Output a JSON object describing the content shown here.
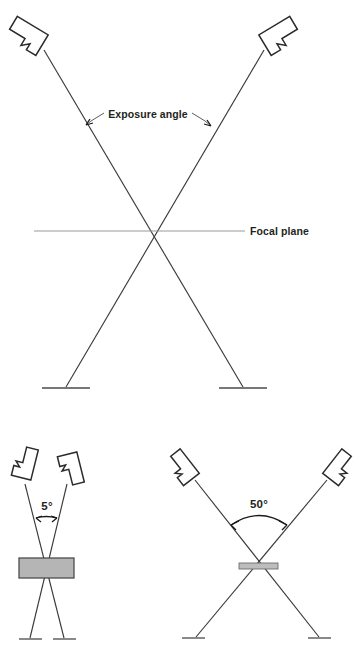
{
  "figure": {
    "background_color": "#ffffff",
    "line_color": "#3a3a3a",
    "focal_line_color": "#9a9a9a",
    "slab_fill_color": "#b5b5b5",
    "text_color": "#231f20"
  },
  "panels": {
    "top": {
      "name": "exposure-angle-panel",
      "labels": {
        "exposure_angle": "Exposure angle",
        "focal_plane": "Focal plane"
      },
      "tube_heads": [
        {
          "name": "x-ray-tube-head-left",
          "position": "top-left"
        },
        {
          "name": "x-ray-tube-head-right",
          "position": "top-right"
        }
      ],
      "beams": [
        {
          "name": "beam-left-to-right",
          "from": "top-left",
          "to": "bottom-right"
        },
        {
          "name": "beam-right-to-left",
          "from": "top-right",
          "to": "bottom-left"
        }
      ],
      "bases": [
        {
          "name": "film-base-left"
        },
        {
          "name": "film-base-right"
        }
      ]
    },
    "bottom_left": {
      "name": "narrow-angle-panel",
      "angle_label": "5°",
      "angle_degrees": 5,
      "slab": {
        "name": "thick-focal-plane-slab",
        "description": "thick focal plane",
        "fill": "#b5b5b5"
      },
      "tube_heads": [
        {
          "name": "x-ray-tube-head-left",
          "position": "top-left"
        },
        {
          "name": "x-ray-tube-head-right",
          "position": "top-right"
        }
      ],
      "bases": [
        {
          "name": "film-base-left"
        },
        {
          "name": "film-base-right"
        }
      ]
    },
    "bottom_right": {
      "name": "wide-angle-panel",
      "angle_label": "50°",
      "angle_degrees": 50,
      "slab": {
        "name": "thin-focal-plane-slab",
        "description": "thin focal plane",
        "fill": "#bdbdbd"
      },
      "tube_heads": [
        {
          "name": "x-ray-tube-head-left",
          "position": "top-left"
        },
        {
          "name": "x-ray-tube-head-right",
          "position": "top-right"
        }
      ],
      "bases": [
        {
          "name": "film-base-left"
        },
        {
          "name": "film-base-right"
        }
      ]
    }
  }
}
